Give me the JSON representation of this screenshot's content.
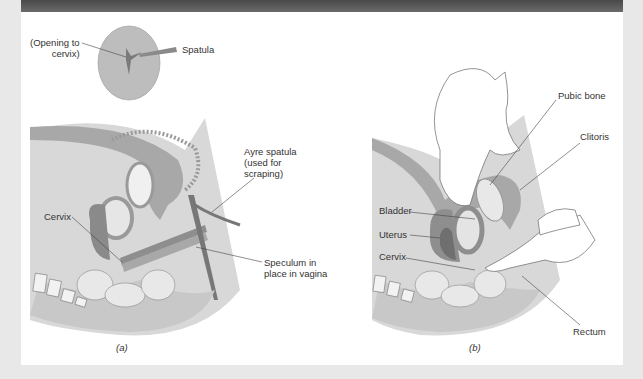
{
  "figure": {
    "panel_a": {
      "caption": "(a)",
      "labels": {
        "opening": [
          "(Opening to",
          "cervix)"
        ],
        "spatula": "Spatula",
        "ayre": [
          "Ayre spatula",
          "(used for",
          "scraping)"
        ],
        "cervix": "Cervix",
        "speculum": [
          "Speculum in",
          "place in vagina"
        ]
      }
    },
    "panel_b": {
      "caption": "(b)",
      "labels": {
        "pubic_bone": "Pubic bone",
        "clitoris": "Clitoris",
        "bladder": "Bladder",
        "uterus": "Uterus",
        "cervix": "Cervix",
        "rectum": "Rectum"
      }
    },
    "colors": {
      "header": "#555555",
      "tissue": "#a9a9a9",
      "tissue_light": "#cfcfcf",
      "organ": "#8e8e8e",
      "background": "#e8e8e8"
    }
  }
}
